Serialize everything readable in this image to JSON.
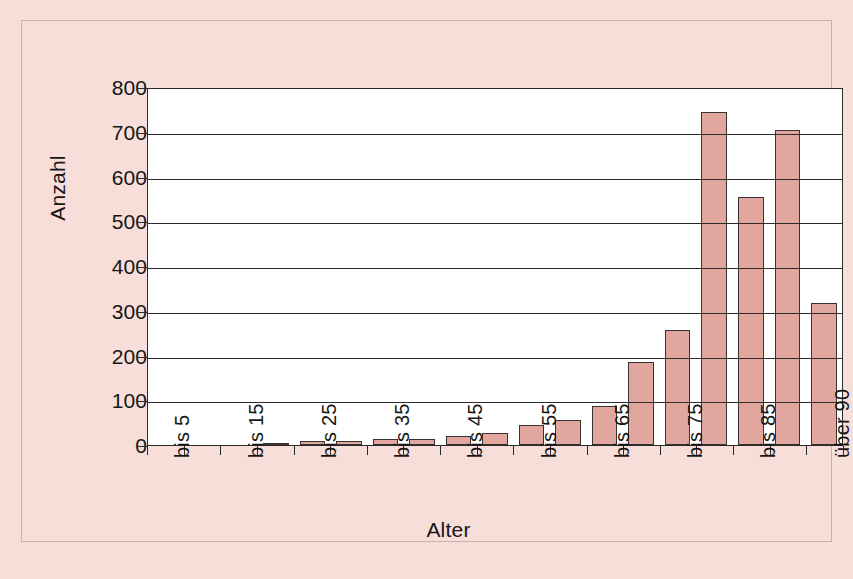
{
  "chart_data": {
    "type": "bar",
    "title": "",
    "xlabel": "Alter",
    "ylabel": "Anzahl",
    "ylim": [
      0,
      800
    ],
    "ytick_values": [
      800,
      700,
      600,
      500,
      400,
      300,
      200,
      100,
      0
    ],
    "ytick_labels": [
      "800",
      "700",
      "600",
      "500",
      "400",
      "300",
      "200",
      "100",
      "0"
    ],
    "grid": true,
    "legend": "none",
    "categories": [
      "bis 5",
      "bis 10",
      "bis 15",
      "bis 20",
      "bis 25",
      "bis 30",
      "bis 35",
      "bis 40",
      "bis 45",
      "bis 50",
      "bis 55",
      "bis 60",
      "bis 65",
      "bis 70",
      "bis 75",
      "bis 80",
      "bis 85",
      "bis 90",
      "über 90"
    ],
    "visible_tick_labels": [
      "bis 5",
      "",
      "bis 15",
      "",
      "bis 25",
      "",
      "bis 35",
      "",
      "bis 45",
      "",
      "bis 55",
      "",
      "bis 65",
      "",
      "bis 75",
      "",
      "bis 85",
      "",
      "über 90"
    ],
    "values": [
      0,
      0,
      0,
      2,
      9,
      9,
      14,
      14,
      20,
      26,
      45,
      57,
      88,
      186,
      258,
      745,
      555,
      705,
      318
    ],
    "colors": {
      "bar_fill": "#e1a79f",
      "bar_border": "#3a3230",
      "plot_background": "#ffffff",
      "page_background": "#f7ded9",
      "axis": "#2b2b2b",
      "text": "#161616"
    }
  }
}
